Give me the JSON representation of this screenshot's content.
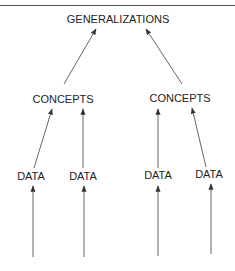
{
  "diagram": {
    "title_rule": true,
    "top": {
      "label": "GENERALIZATIONS"
    },
    "concepts": [
      {
        "label": "CONCEPTS"
      },
      {
        "label": "CONCEPTS"
      }
    ],
    "data": [
      {
        "label": "DATA"
      },
      {
        "label": "DATA"
      },
      {
        "label": "DATA"
      },
      {
        "label": "DATA"
      }
    ],
    "colors": {
      "line": "#444444",
      "text": "#222222"
    }
  }
}
